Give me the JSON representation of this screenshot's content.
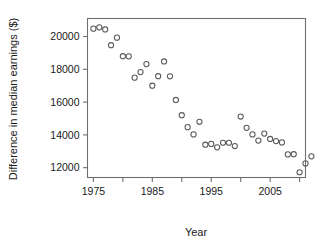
{
  "chart_data": {
    "type": "scatter",
    "title": "",
    "xlabel": "Year",
    "ylabel": "Difference in median earnings ($)",
    "xlim": [
      1974.0,
      1911.0
    ],
    "x_range": [
      1974.0,
      2011.0
    ],
    "ylim": [
      11400,
      21100
    ],
    "grid": false,
    "legend": null,
    "x_ticks": [
      1975,
      1980,
      1985,
      1990,
      1995,
      2000,
      2005,
      2010
    ],
    "x_tick_labels": [
      "1975",
      "",
      "1985",
      "",
      "1995",
      "",
      "2005",
      ""
    ],
    "x_minor_ticks": [
      1980,
      1990,
      2000,
      2010
    ],
    "y_ticks": [
      12000,
      14000,
      16000,
      18000,
      20000
    ],
    "y_tick_labels": [
      "12000",
      "14000",
      "16000",
      "18000",
      "20000"
    ],
    "point_style": {
      "marker": "open-circle",
      "radius": 2.6,
      "stroke": "#5a5a5a"
    },
    "x": [
      1975,
      1976,
      1977,
      1978,
      1979,
      1980,
      1981,
      1982,
      1983,
      1984,
      1985,
      1986,
      1987,
      1988,
      1989,
      1990,
      1991,
      1992,
      1993,
      1994,
      1995,
      1996,
      1997,
      1998,
      1999,
      2000,
      2001,
      2002,
      2003,
      2004,
      2005,
      2006,
      2007,
      2008,
      2009,
      2010
    ],
    "y": [
      20480,
      20560,
      20430,
      19470,
      19930,
      18800,
      18790,
      17490,
      17830,
      18320,
      17000,
      17580,
      18480,
      17570,
      16130,
      15200,
      14470,
      14030,
      14800,
      13400,
      13450,
      13240,
      13520,
      13520,
      13320,
      15120,
      14430,
      14030,
      13650,
      14080,
      13750,
      13620,
      13540,
      12810,
      12820,
      11720,
      12260,
      12690
    ],
    "points": [
      {
        "x": 1975,
        "y": 20480
      },
      {
        "x": 1976,
        "y": 20560
      },
      {
        "x": 1977,
        "y": 20430
      },
      {
        "x": 1978,
        "y": 19470
      },
      {
        "x": 1979,
        "y": 19930
      },
      {
        "x": 1980,
        "y": 18800
      },
      {
        "x": 1981,
        "y": 18790
      },
      {
        "x": 1982,
        "y": 17490
      },
      {
        "x": 1983,
        "y": 17830
      },
      {
        "x": 1984,
        "y": 18320
      },
      {
        "x": 1985,
        "y": 17000
      },
      {
        "x": 1986,
        "y": 17580
      },
      {
        "x": 1987,
        "y": 18480
      },
      {
        "x": 1988,
        "y": 17570
      },
      {
        "x": 1989,
        "y": 16130
      },
      {
        "x": 1990,
        "y": 15200
      },
      {
        "x": 1991,
        "y": 14470
      },
      {
        "x": 1992,
        "y": 14030
      },
      {
        "x": 1993,
        "y": 14800
      },
      {
        "x": 1994,
        "y": 13400
      },
      {
        "x": 1995,
        "y": 13450
      },
      {
        "x": 1996,
        "y": 13240
      },
      {
        "x": 1997,
        "y": 13520
      },
      {
        "x": 1998,
        "y": 13520
      },
      {
        "x": 1999,
        "y": 13320
      },
      {
        "x": 2000,
        "y": 15120
      },
      {
        "x": 2001,
        "y": 14430
      },
      {
        "x": 2002,
        "y": 14030
      },
      {
        "x": 2003,
        "y": 13650
      },
      {
        "x": 2004,
        "y": 14080
      },
      {
        "x": 2005,
        "y": 13750
      },
      {
        "x": 2006,
        "y": 13620
      },
      {
        "x": 2007,
        "y": 13540
      },
      {
        "x": 2008,
        "y": 12810
      },
      {
        "x": 2009,
        "y": 12820
      },
      {
        "x": 2010,
        "y": 11720
      },
      {
        "x": 2011,
        "y": 12260
      },
      {
        "x": 2012,
        "y": 12690
      }
    ]
  },
  "colors": {
    "background": "#ffffff",
    "axis": "#6f6f6f",
    "text": "#1a1a1a",
    "marker": "#5a5a5a"
  }
}
